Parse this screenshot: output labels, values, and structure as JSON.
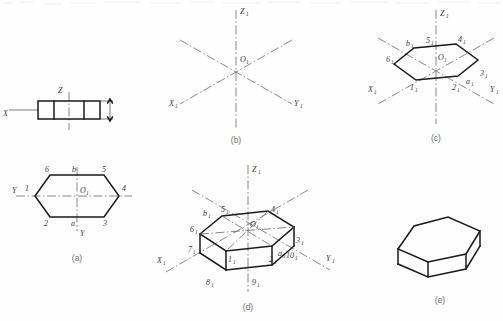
{
  "figure": {
    "caption_a": "(a)",
    "caption_b": "(b)",
    "caption_c": "(c)",
    "caption_d": "(d)",
    "caption_e": "(e)"
  },
  "panel_a": {
    "name": "orthographic-views",
    "front_view": {
      "axis_x_label": "X",
      "axis_z_label": "Z",
      "divisions": 3,
      "thickness_dim": true
    },
    "top_view": {
      "axis_y_left_label": "Y",
      "axis_y_down_label": "Y",
      "origin_label": "O",
      "origin_sub": "1",
      "vertices": [
        {
          "id": "1",
          "pos": "left"
        },
        {
          "id": "2",
          "pos": "bottom-left"
        },
        {
          "id": "3",
          "pos": "bottom-right"
        },
        {
          "id": "4",
          "pos": "right"
        },
        {
          "id": "5",
          "pos": "top-right"
        },
        {
          "id": "6",
          "pos": "top-left"
        }
      ],
      "midpoints": [
        {
          "id": "a",
          "pos": "bottom-mid"
        },
        {
          "id": "b",
          "pos": "top-mid"
        }
      ]
    }
  },
  "panel_b": {
    "name": "isometric-axes",
    "axes": [
      {
        "label": "Z",
        "sub": "1",
        "dir": "up"
      },
      {
        "label": "X",
        "sub": "1",
        "dir": "lower-left"
      },
      {
        "label": "Y",
        "sub": "1",
        "dir": "lower-right"
      }
    ],
    "origin_label": "O",
    "origin_sub": "1"
  },
  "panel_c": {
    "name": "isometric-hexagon",
    "axes": [
      {
        "label": "Z",
        "sub": "1"
      },
      {
        "label": "X",
        "sub": "1"
      },
      {
        "label": "Y",
        "sub": "1"
      }
    ],
    "origin_label": "O",
    "origin_sub": "1",
    "vertices": [
      {
        "label": "1",
        "sub": "1"
      },
      {
        "label": "2",
        "sub": "1"
      },
      {
        "label": "3",
        "sub": "1"
      },
      {
        "label": "4",
        "sub": "1"
      },
      {
        "label": "5",
        "sub": "1"
      },
      {
        "label": "6",
        "sub": "1"
      }
    ],
    "midpoints": [
      {
        "label": "a",
        "sub": "1"
      },
      {
        "label": "b",
        "sub": "1"
      }
    ]
  },
  "panel_d": {
    "name": "isometric-prism-construction",
    "axes": [
      {
        "label": "Z",
        "sub": "1"
      },
      {
        "label": "X",
        "sub": "1"
      },
      {
        "label": "Y",
        "sub": "1"
      }
    ],
    "origin_label": "O",
    "origin_sub": "1",
    "top_vertices": [
      {
        "label": "1",
        "sub": "1"
      },
      {
        "label": "2",
        "sub": "1"
      },
      {
        "label": "3",
        "sub": "1"
      },
      {
        "label": "4",
        "sub": "1"
      },
      {
        "label": "5",
        "sub": "1"
      },
      {
        "label": "6",
        "sub": "1"
      }
    ],
    "bottom_vertices": [
      {
        "label": "7",
        "sub": "1"
      },
      {
        "label": "8",
        "sub": "1"
      },
      {
        "label": "9",
        "sub": "1"
      },
      {
        "label": "10",
        "sub": "1"
      }
    ],
    "midpoints": [
      {
        "label": "a",
        "sub": "1"
      },
      {
        "label": "b",
        "sub": "1"
      }
    ]
  },
  "panel_e": {
    "name": "finished-prism",
    "description": "completed hexagonal prism outline"
  }
}
